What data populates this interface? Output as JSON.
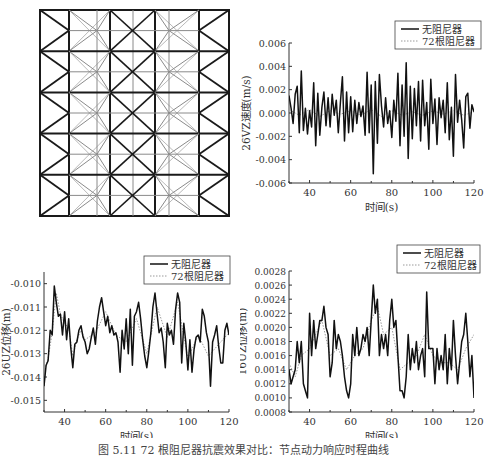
{
  "figure": {
    "caption": "图 5.11  72 根阻尼器抗震效果对比：节点动力响应时程曲线"
  },
  "truss": {
    "label": "Truss structure plan with damper layout",
    "cols": 5,
    "rows": 5,
    "stroke_heavy": "#1a1a1a",
    "stroke_light": "#8a8a8a"
  },
  "legend": {
    "series_1": "无阻尼器",
    "series_2": "72根阻尼器"
  },
  "chart_data": [
    {
      "id": "velocity-26VZ",
      "type": "line",
      "title": "",
      "xlabel": "时间(s)",
      "ylabel": "26VZ速度(m/s)",
      "xlim": [
        30,
        120
      ],
      "ylim": [
        -0.006,
        0.006
      ],
      "xticks": [
        40,
        60,
        80,
        100,
        120
      ],
      "xtick_labels": [
        "40",
        "60",
        "80",
        "100",
        "120"
      ],
      "yticks": [
        -0.006,
        -0.004,
        -0.002,
        0.0,
        0.002,
        0.004,
        0.006
      ],
      "ytick_labels": [
        "-0.006",
        "-0.004",
        "-0.002",
        "0.000",
        "0.002",
        "0.004",
        "0.006"
      ],
      "legend_position": "upper right (outside top)",
      "grid": false,
      "series": [
        {
          "name": "无阻尼器",
          "style": "solid",
          "x": [
            30,
            31,
            32,
            33,
            34,
            35,
            36,
            37,
            38,
            39,
            40,
            41,
            42,
            43,
            44,
            45,
            46,
            47,
            48,
            49,
            50,
            51,
            52,
            53,
            54,
            55,
            56,
            57,
            58,
            59,
            60,
            61,
            62,
            63,
            64,
            65,
            66,
            67,
            68,
            69,
            70,
            71,
            72,
            73,
            74,
            75,
            76,
            77,
            78,
            79,
            80,
            81,
            82,
            83,
            84,
            85,
            86,
            87,
            88,
            89,
            90,
            91,
            92,
            93,
            94,
            95,
            96,
            97,
            98,
            99,
            100,
            101,
            102,
            103,
            104,
            105,
            106,
            107,
            108,
            109,
            110,
            111,
            112,
            113,
            114,
            115,
            116,
            117,
            118,
            119,
            120
          ],
          "values": [
            0.0015,
            0.0004,
            -0.0009,
            0.0016,
            0.0023,
            -0.0017,
            0.0036,
            -0.0015,
            0.0004,
            -0.0018,
            0.0002,
            -0.0012,
            0.0026,
            -0.0028,
            0.0017,
            -0.0019,
            0.0005,
            0.0018,
            -0.0011,
            0.0013,
            -0.0012,
            0.0016,
            -0.0002,
            0.0011,
            -0.0017,
            0.0009,
            0.0031,
            -0.0024,
            0.0018,
            -0.0017,
            0.0014,
            -0.0016,
            0.0011,
            -0.0009,
            0.0009,
            -0.0003,
            0.0006,
            -0.0019,
            0.0035,
            -0.0017,
            0.0024,
            -0.0052,
            0.0027,
            -0.0026,
            0.0033,
            0.0006,
            -0.0012,
            0.0013,
            -0.0009,
            0.0002,
            -0.0021,
            0.0011,
            -0.0007,
            0.0034,
            -0.0028,
            0.0024,
            -0.002,
            0.0043,
            -0.0039,
            0.0023,
            -0.0022,
            0.0021,
            -0.0011,
            0.0027,
            -0.0024,
            0.0028,
            -0.0011,
            0.0009,
            -0.0031,
            0.0029,
            -0.0009,
            0.0012,
            -0.0027,
            0.0013,
            -0.0004,
            0.0011,
            -0.0017,
            0.0026,
            -0.0023,
            0.0005,
            -0.0037,
            0.0033,
            -0.0008,
            0.0011,
            -0.0006,
            -0.003,
            0.0014,
            0.0017,
            -0.0013,
            0.0007,
            0.0001
          ]
        },
        {
          "name": "72根阻尼器",
          "style": "dotted",
          "x": [
            30,
            35,
            40,
            45,
            50,
            55,
            60,
            65,
            70,
            75,
            80,
            85,
            90,
            95,
            100,
            105,
            110,
            115,
            120
          ],
          "values": [
            0.0003,
            -0.0002,
            0.0003,
            -0.0003,
            0.0002,
            -0.0001,
            0.0002,
            -0.0002,
            0.0003,
            -0.0003,
            0.0002,
            -0.0002,
            0.0001,
            -0.0002,
            0.0002,
            -0.0001,
            0.0002,
            -0.0002,
            0.0001
          ]
        }
      ]
    },
    {
      "id": "displacement-26UZ",
      "type": "line",
      "title": "",
      "xlabel": "时间(s)",
      "ylabel": "26UZ位移(m)",
      "xlim": [
        30,
        120
      ],
      "ylim": [
        -0.0155,
        -0.0095
      ],
      "xticks": [
        40,
        60,
        80,
        100,
        120
      ],
      "xtick_labels": [
        "40",
        "60",
        "80",
        "100",
        "120"
      ],
      "yticks": [
        -0.015,
        -0.014,
        -0.013,
        -0.012,
        -0.011,
        -0.01
      ],
      "ytick_labels": [
        "-0.015",
        "-0.014",
        "-0.013",
        "-0.012",
        "-0.011",
        "-0.010"
      ],
      "legend_position": "upper right",
      "grid": false,
      "series": [
        {
          "name": "无阻尼器",
          "style": "solid",
          "x": [
            30,
            31,
            32,
            33,
            34,
            35,
            36,
            37,
            38,
            39,
            40,
            41,
            42,
            43,
            44,
            45,
            46,
            47,
            48,
            49,
            50,
            51,
            52,
            53,
            54,
            55,
            56,
            57,
            58,
            59,
            60,
            61,
            62,
            63,
            64,
            65,
            66,
            67,
            68,
            69,
            70,
            71,
            72,
            73,
            74,
            75,
            76,
            77,
            78,
            79,
            80,
            81,
            82,
            83,
            84,
            85,
            86,
            87,
            88,
            89,
            90,
            91,
            92,
            93,
            94,
            95,
            96,
            97,
            98,
            99,
            100,
            101,
            102,
            103,
            104,
            105,
            106,
            107,
            108,
            109,
            110,
            111,
            112,
            113,
            114,
            115,
            116,
            117,
            118,
            119,
            120
          ],
          "values": [
            -0.0144,
            -0.0135,
            -0.0133,
            -0.012,
            -0.0122,
            -0.0101,
            -0.0108,
            -0.0114,
            -0.0113,
            -0.0122,
            -0.0112,
            -0.0124,
            -0.0115,
            -0.0127,
            -0.0136,
            -0.0126,
            -0.0125,
            -0.012,
            -0.0118,
            -0.0123,
            -0.0125,
            -0.013,
            -0.0128,
            -0.0123,
            -0.0119,
            -0.0126,
            -0.0116,
            -0.011,
            -0.0106,
            -0.0112,
            -0.0118,
            -0.0114,
            -0.0121,
            -0.0118,
            -0.0122,
            -0.0121,
            -0.0125,
            -0.0138,
            -0.012,
            -0.0128,
            -0.0115,
            -0.013,
            -0.0111,
            -0.0135,
            -0.0114,
            -0.0112,
            -0.0108,
            -0.0115,
            -0.0124,
            -0.0131,
            -0.0136,
            -0.0129,
            -0.0121,
            -0.011,
            -0.0104,
            -0.0113,
            -0.0121,
            -0.0119,
            -0.0125,
            -0.0136,
            -0.0117,
            -0.0122,
            -0.012,
            -0.0126,
            -0.0111,
            -0.0104,
            -0.0108,
            -0.0134,
            -0.0117,
            -0.0125,
            -0.0137,
            -0.0124,
            -0.0138,
            -0.0128,
            -0.0123,
            -0.0122,
            -0.0125,
            -0.0111,
            -0.0114,
            -0.0121,
            -0.0125,
            -0.0144,
            -0.0125,
            -0.0122,
            -0.0118,
            -0.0127,
            -0.0134,
            -0.0134,
            -0.012,
            -0.0117,
            -0.0122
          ]
        },
        {
          "name": "72根阻尼器",
          "style": "dotted",
          "x": [
            30,
            32,
            34,
            36,
            38,
            40,
            42,
            44,
            46,
            48,
            50,
            55,
            60,
            65,
            70,
            75,
            80,
            85,
            90,
            95,
            100,
            105,
            110,
            115,
            120
          ],
          "values": [
            -0.0138,
            -0.0132,
            -0.0121,
            -0.0104,
            -0.0113,
            -0.0117,
            -0.0119,
            -0.0131,
            -0.0124,
            -0.012,
            -0.0124,
            -0.0121,
            -0.0112,
            -0.0122,
            -0.0125,
            -0.0115,
            -0.013,
            -0.011,
            -0.0123,
            -0.0108,
            -0.0132,
            -0.0122,
            -0.0131,
            -0.0126,
            -0.0121
          ]
        }
      ]
    },
    {
      "id": "displacement-16UZ",
      "type": "line",
      "title": "",
      "xlabel": "时间(s)",
      "ylabel": "16UZ位移(m)",
      "xlim": [
        30,
        120
      ],
      "ylim": [
        0.0008,
        0.0028
      ],
      "xticks": [
        40,
        60,
        80,
        100,
        120
      ],
      "xtick_labels": [
        "40",
        "60",
        "80",
        "100",
        "120"
      ],
      "yticks": [
        0.0008,
        0.001,
        0.0012,
        0.0014,
        0.0016,
        0.0018,
        0.002,
        0.0022,
        0.0024,
        0.0026,
        0.0028
      ],
      "ytick_labels": [
        "0.0008",
        "0.0010",
        "0.0012",
        "0.0014",
        "0.0016",
        "0.0018",
        "0.0020",
        "0.0022",
        "0.0024",
        "0.0026",
        "0.0028"
      ],
      "legend_position": "upper right (outside top)",
      "grid": false,
      "series": [
        {
          "name": "无阻尼器",
          "style": "solid",
          "x": [
            30,
            31,
            32,
            33,
            34,
            35,
            36,
            37,
            38,
            39,
            40,
            41,
            42,
            43,
            44,
            45,
            46,
            47,
            48,
            49,
            50,
            51,
            52,
            53,
            54,
            55,
            56,
            57,
            58,
            59,
            60,
            61,
            62,
            63,
            64,
            65,
            66,
            67,
            68,
            69,
            70,
            71,
            72,
            73,
            74,
            75,
            76,
            77,
            78,
            79,
            80,
            81,
            82,
            83,
            84,
            85,
            86,
            87,
            88,
            89,
            90,
            91,
            92,
            93,
            94,
            95,
            96,
            97,
            98,
            99,
            100,
            101,
            102,
            103,
            104,
            105,
            106,
            107,
            108,
            109,
            110,
            111,
            112,
            113,
            114,
            115,
            116,
            117,
            118,
            119,
            120
          ],
          "values": [
            0.0014,
            0.0012,
            0.0013,
            0.0014,
            0.0018,
            0.0015,
            0.0018,
            0.0012,
            0.0011,
            0.001,
            0.0022,
            0.0016,
            0.0021,
            0.0017,
            0.0019,
            0.0021,
            0.0021,
            0.0023,
            0.002,
            0.0019,
            0.0013,
            0.0015,
            0.0021,
            0.0017,
            0.0019,
            0.0018,
            0.0016,
            0.0013,
            0.0011,
            0.001,
            0.0012,
            0.0019,
            0.0016,
            0.002,
            0.0016,
            0.0017,
            0.0019,
            0.0018,
            0.002,
            0.0016,
            0.0021,
            0.0026,
            0.0022,
            0.0024,
            0.0016,
            0.0019,
            0.0017,
            0.0019,
            0.0016,
            0.0021,
            0.0024,
            0.002,
            0.0021,
            0.0016,
            0.0011,
            0.0011,
            0.001,
            0.0013,
            0.0019,
            0.0014,
            0.0017,
            0.0015,
            0.0018,
            0.0014,
            0.0016,
            0.0017,
            0.0013,
            0.0025,
            0.0017,
            0.0017,
            0.0017,
            0.0012,
            0.0017,
            0.0014,
            0.0016,
            0.0014,
            0.0019,
            0.0012,
            0.0017,
            0.0014,
            0.0021,
            0.0016,
            0.0012,
            0.0015,
            0.0018,
            0.0019,
            0.0022,
            0.0018,
            0.0013,
            0.0016,
            0.001
          ]
        },
        {
          "name": "72根阻尼器",
          "style": "dotted",
          "x": [
            30,
            33,
            36,
            40,
            43,
            46,
            50,
            54,
            58,
            62,
            66,
            70,
            73,
            76,
            80,
            84,
            88,
            92,
            96,
            100,
            104,
            108,
            112,
            116,
            120
          ],
          "values": [
            0.0015,
            0.0013,
            0.0016,
            0.0017,
            0.0019,
            0.0021,
            0.0016,
            0.0017,
            0.0014,
            0.0016,
            0.0017,
            0.0021,
            0.0023,
            0.0019,
            0.002,
            0.0014,
            0.0015,
            0.0016,
            0.0019,
            0.0016,
            0.0015,
            0.0015,
            0.0014,
            0.0017,
            0.0019
          ]
        }
      ]
    }
  ]
}
